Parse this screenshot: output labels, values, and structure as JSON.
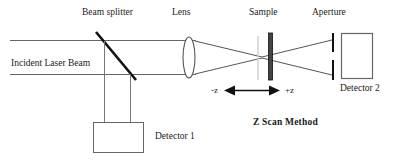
{
  "figure": {
    "title": "Z Scan Method",
    "labels": {
      "beam_splitter": "Beam splitter",
      "lens": "Lens",
      "sample": "Sample",
      "aperture": "Aperture",
      "incident_beam": "Incident Laser Beam",
      "detector_1": "Detector 1",
      "detector_2": "Detector 2",
      "axis_negative": "-z",
      "axis_positive": "+z"
    },
    "colors": {
      "stroke": "#555555",
      "dark_stroke": "#111111",
      "text": "#1a1a1a",
      "background": "#ffffff",
      "focal_marker": "#cccccc"
    },
    "components": [
      {
        "name": "incident-laser-beam",
        "type": "ray-pair",
        "label": "Incident Laser Beam"
      },
      {
        "name": "beam-splitter",
        "type": "diagonal-mirror",
        "label": "Beam splitter"
      },
      {
        "name": "lens",
        "type": "biconvex-lens",
        "label": "Lens"
      },
      {
        "name": "sample",
        "type": "vertical-slab",
        "label": "Sample"
      },
      {
        "name": "aperture",
        "type": "split-stop",
        "label": "Aperture"
      },
      {
        "name": "detector-1",
        "type": "box",
        "label": "Detector 1"
      },
      {
        "name": "detector-2",
        "type": "box",
        "label": "Detector 2"
      },
      {
        "name": "z-translation-axis",
        "type": "double-arrow",
        "label": "-z  +z"
      }
    ]
  }
}
